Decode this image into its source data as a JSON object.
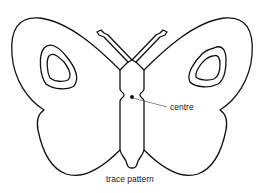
{
  "diagram": {
    "labels": {
      "centre": "centre",
      "caption": "trace pattern"
    },
    "colors": {
      "line": "#111111",
      "background": "#ffffff"
    }
  }
}
